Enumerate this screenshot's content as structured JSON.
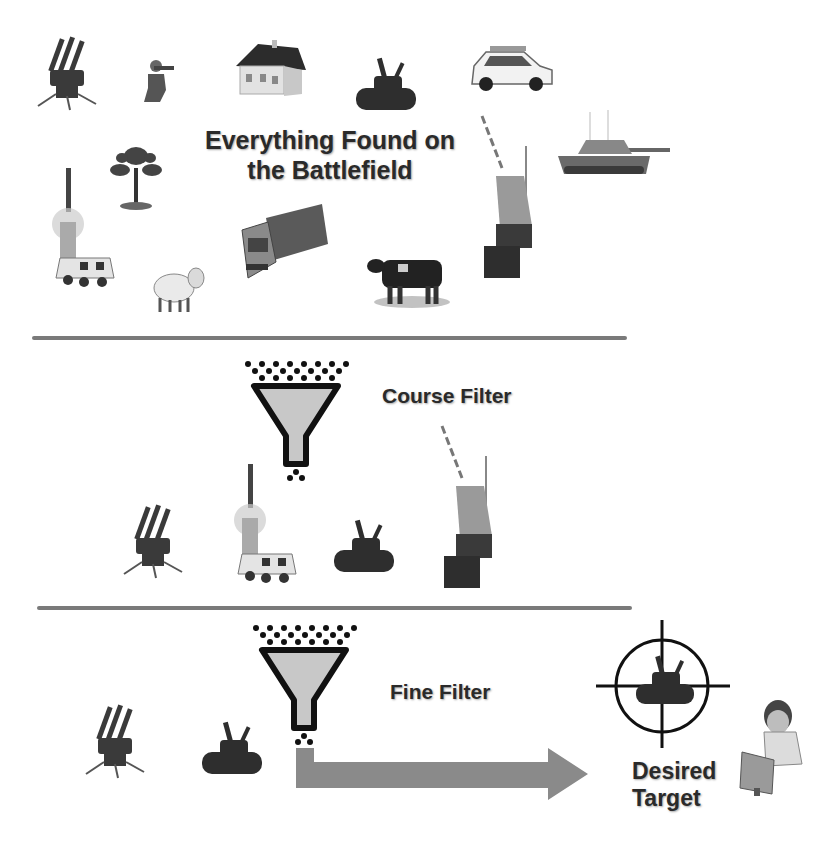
{
  "colors": {
    "background": "#ffffff",
    "text": "#2a2a2a",
    "divider": "#7a7a7a",
    "funnel_fill": "#c8c8c8",
    "funnel_outline": "#111111",
    "arrow": "#8a8a8a",
    "crosshair": "#111111"
  },
  "section_top": {
    "title_line1": "Everything Found on",
    "title_line2": "the Battlefield",
    "items": [
      {
        "icon": "missile-launcher-icon"
      },
      {
        "icon": "soldier-icon"
      },
      {
        "icon": "house-icon"
      },
      {
        "icon": "anti-aircraft-tank-icon"
      },
      {
        "icon": "police-car-icon"
      },
      {
        "icon": "tree-icon"
      },
      {
        "icon": "battle-tank-icon"
      },
      {
        "icon": "rocket-launch-truck-icon"
      },
      {
        "icon": "cargo-truck-icon"
      },
      {
        "icon": "sheep-icon"
      },
      {
        "icon": "cow-icon"
      },
      {
        "icon": "radar-tower-vehicle-icon"
      }
    ]
  },
  "section_middle": {
    "label": "Course Filter",
    "filter_icon": "funnel-icon",
    "items": [
      {
        "icon": "missile-launcher-icon"
      },
      {
        "icon": "rocket-launch-truck-icon"
      },
      {
        "icon": "anti-aircraft-tank-icon"
      },
      {
        "icon": "radar-tower-vehicle-icon"
      }
    ]
  },
  "section_bottom": {
    "label": "Fine Filter",
    "filter_icon": "funnel-icon",
    "items": [
      {
        "icon": "missile-launcher-icon"
      },
      {
        "icon": "anti-aircraft-tank-icon"
      }
    ],
    "result_label_line1": "Desired",
    "result_label_line2": "Target",
    "result_icon": "crosshair-target-icon",
    "operator_icon": "operator-at-computer-icon"
  }
}
